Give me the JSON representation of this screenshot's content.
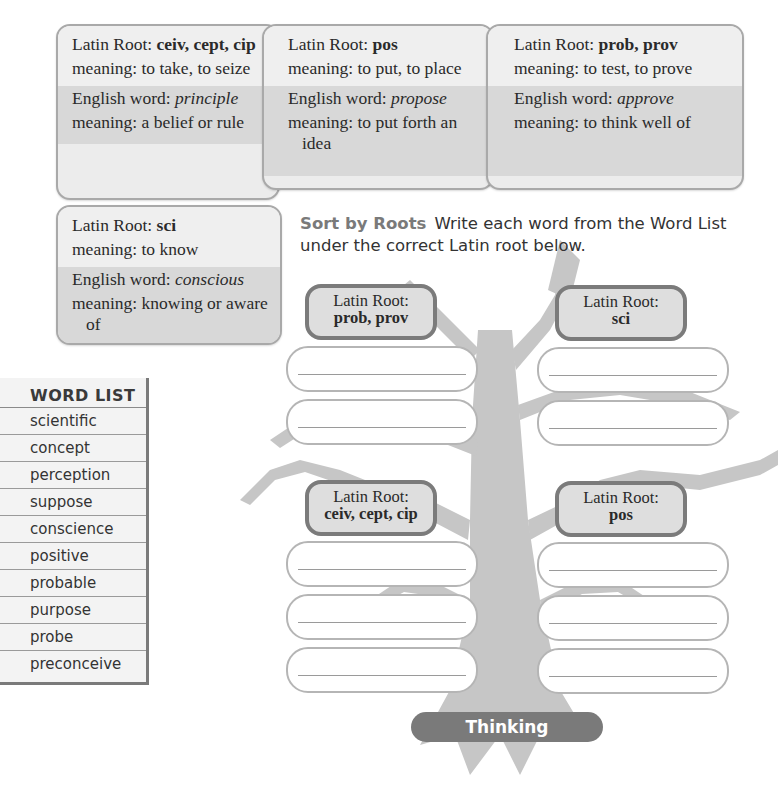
{
  "root_cards": [
    {
      "latin_label": "Latin Root: ",
      "latin_value": "ceiv, cept, cip",
      "latin_meaning": "meaning: to take, to seize",
      "english_label": "English word: ",
      "english_value": "principle",
      "english_meaning": "meaning: a belief or rule"
    },
    {
      "latin_label": "Latin Root: ",
      "latin_value": "pos",
      "latin_meaning": "meaning: to put, to place",
      "english_label": "English word: ",
      "english_value": "propose",
      "english_meaning": "meaning: to put forth an idea"
    },
    {
      "latin_label": "Latin Root: ",
      "latin_value": "prob, prov",
      "latin_meaning": "meaning: to test, to prove",
      "english_label": "English word: ",
      "english_value": "approve",
      "english_meaning": "meaning: to think well of"
    },
    {
      "latin_label": "Latin Root: ",
      "latin_value": "sci",
      "latin_meaning": "meaning: to know",
      "english_label": "English word: ",
      "english_value": "conscious",
      "english_meaning": "meaning: knowing or aware of"
    }
  ],
  "word_list": {
    "title": "WORD LIST",
    "items": [
      "scientific",
      "concept",
      "perception",
      "suppose",
      "conscience",
      "positive",
      "probable",
      "purpose",
      "probe",
      "preconceive"
    ]
  },
  "instructions": {
    "lead": "Sort by Roots",
    "text": "Write each word from the Word List under the correct Latin root below."
  },
  "sort_groups": [
    {
      "label": "Latin Root:",
      "value": "prob, prov",
      "blanks": 2
    },
    {
      "label": "Latin Root:",
      "value": "sci",
      "blanks": 2
    },
    {
      "label": "Latin Root:",
      "value": "ceiv, cept, cip",
      "blanks": 3
    },
    {
      "label": "Latin Root:",
      "value": "pos",
      "blanks": 3
    }
  ],
  "banner": {
    "label": "Thinking"
  },
  "colors": {
    "tree": "#c4c4c4",
    "box_border": "#7b7b7b",
    "banner": "#7a7a7a"
  }
}
